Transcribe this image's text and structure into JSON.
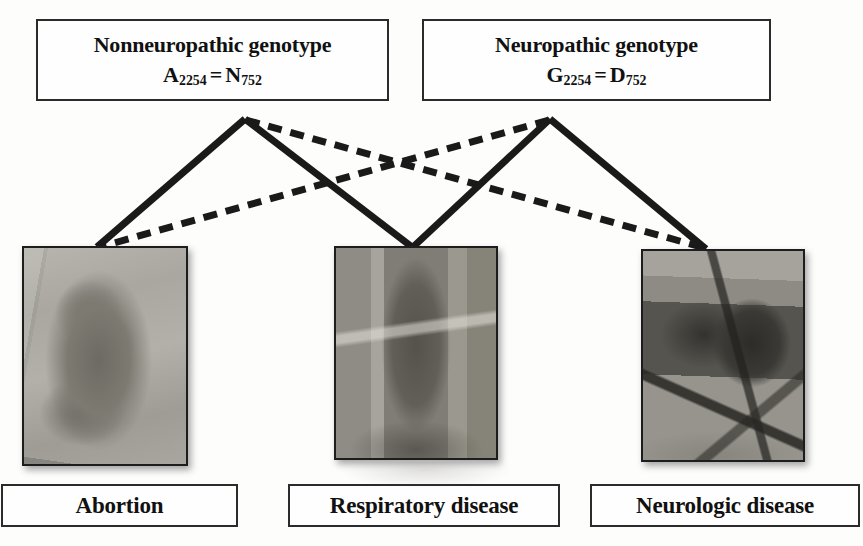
{
  "diagram": {
    "genotypes": [
      {
        "id": "nonneuropathic",
        "title": "Nonneuropathic genotype",
        "nucleotide": "A",
        "nucleotide_position": "2254",
        "equals": "=",
        "amino_acid": "N",
        "amino_acid_position": "752"
      },
      {
        "id": "neuropathic",
        "title": "Neuropathic genotype",
        "nucleotide": "G",
        "nucleotide_position": "2254",
        "equals": "=",
        "amino_acid": "D",
        "amino_acid_position": "752"
      }
    ],
    "outcomes": [
      {
        "id": "abortion",
        "label": "Abortion",
        "photo_caption": "aborted equine fetus in tray"
      },
      {
        "id": "respiratory",
        "label": "Respiratory disease",
        "photo_caption": "horse head with nasal discharge"
      },
      {
        "id": "neurologic",
        "label": "Neurologic disease",
        "photo_caption": "recumbent horse supported in sling"
      }
    ],
    "connections": [
      {
        "from": "nonneuropathic",
        "to": "abortion",
        "style": "solid",
        "meaning": "strong / common association"
      },
      {
        "from": "nonneuropathic",
        "to": "respiratory",
        "style": "solid",
        "meaning": "strong / common association"
      },
      {
        "from": "nonneuropathic",
        "to": "neurologic",
        "style": "dashed",
        "meaning": "weak / less common association"
      },
      {
        "from": "neuropathic",
        "to": "abortion",
        "style": "dashed",
        "meaning": "weak / less common association"
      },
      {
        "from": "neuropathic",
        "to": "respiratory",
        "style": "solid",
        "meaning": "strong / common association"
      },
      {
        "from": "neuropathic",
        "to": "neurologic",
        "style": "solid",
        "meaning": "strong / common association"
      }
    ],
    "colors": {
      "line": "#1a1a1a",
      "box_border": "#2b2b2b",
      "box_fill": "#fefefe",
      "text": "#111111",
      "page_background": "#fdfdfc"
    },
    "line_styles": {
      "solid_width": 7,
      "dashed_width": 7,
      "dash_pattern": "14 9"
    }
  }
}
